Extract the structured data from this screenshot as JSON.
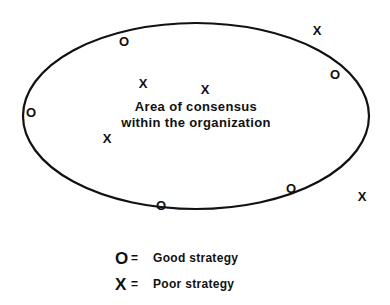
{
  "figure": {
    "type": "venn-like-consensus-diagram",
    "background_color": "#ffffff",
    "stroke_color": "#111111"
  },
  "boundary": {
    "shape": "ellipse",
    "cx": 196,
    "cy": 116,
    "rx": 173,
    "ry": 93,
    "stroke_width": 2.2,
    "fill": "#ffffff"
  },
  "center_label": {
    "line1": "Area of consensus",
    "line2": "within the organization"
  },
  "markers": [
    {
      "symbol": "O",
      "x": 124,
      "y": 41,
      "region": "inside",
      "name": "marker-o-top-left"
    },
    {
      "symbol": "O",
      "x": 31,
      "y": 112,
      "region": "inside",
      "name": "marker-o-left"
    },
    {
      "symbol": "O",
      "x": 335,
      "y": 74,
      "region": "inside",
      "name": "marker-o-right"
    },
    {
      "symbol": "O",
      "x": 161,
      "y": 205,
      "region": "inside",
      "name": "marker-o-bottom"
    },
    {
      "symbol": "O",
      "x": 291,
      "y": 188,
      "region": "inside",
      "name": "marker-o-bottom-right"
    },
    {
      "symbol": "X",
      "x": 143,
      "y": 83,
      "region": "inside",
      "name": "marker-x-inner-upper-left"
    },
    {
      "symbol": "X",
      "x": 205,
      "y": 89,
      "region": "inside",
      "name": "marker-x-inner-upper-right"
    },
    {
      "symbol": "X",
      "x": 107,
      "y": 138,
      "region": "inside",
      "name": "marker-x-inner-lower-left"
    },
    {
      "symbol": "X",
      "x": 317,
      "y": 30,
      "region": "outside",
      "name": "marker-x-outside-top-right"
    },
    {
      "symbol": "X",
      "x": 362,
      "y": 196,
      "region": "outside",
      "name": "marker-x-outside-bottom-right"
    }
  ],
  "legend": {
    "rows": [
      {
        "symbol": "O",
        "equals": "=",
        "label": "Good strategy"
      },
      {
        "symbol": "X",
        "equals": "=",
        "label": "Poor strategy"
      }
    ]
  }
}
